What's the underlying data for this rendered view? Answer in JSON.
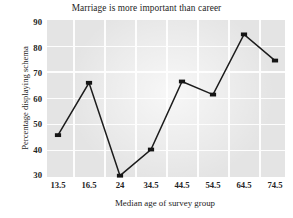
{
  "chart_data": {
    "type": "line",
    "title": "Marriage is more important than career",
    "xlabel": "Median age of survey group",
    "ylabel": "Percentage displaying schema",
    "categories": [
      "13.5",
      "16.5",
      "24",
      "34.5",
      "44.5",
      "54.5",
      "64.5",
      "74.5"
    ],
    "x": [
      13.5,
      16.5,
      24,
      34.5,
      44.5,
      54.5,
      64.5,
      74.5
    ],
    "values": [
      46,
      66,
      30.5,
      40.5,
      66.5,
      61.5,
      84.5,
      74.5
    ],
    "series": [
      {
        "name": "Percentage displaying schema",
        "values": [
          46,
          66,
          30.5,
          40.5,
          66.5,
          61.5,
          84.5,
          74.5
        ]
      }
    ],
    "yticks": [
      30,
      40,
      50,
      60,
      70,
      80,
      90
    ],
    "ylim": [
      30,
      90
    ],
    "xtick_labels": [
      "13.5",
      "16.5",
      "24",
      "34.5",
      "44.5",
      "54.5",
      "64.5",
      "74.5"
    ],
    "grid": true,
    "legend": false,
    "marker": "square",
    "line_color": "#1c1c1c",
    "marker_color": "#151515",
    "plot_background": "#e4e4e4",
    "gridline_color": "#fdfdfd"
  }
}
